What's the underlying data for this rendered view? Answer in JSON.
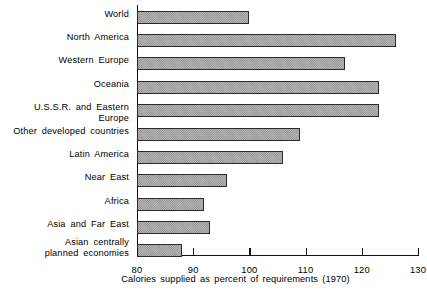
{
  "chart_data": {
    "type": "bar",
    "orientation": "horizontal",
    "title": "",
    "xlabel": "Calories supplied as percent of requirements (1970)",
    "ylabel": "",
    "xlim": [
      80,
      130
    ],
    "xticks": [
      80,
      90,
      100,
      110,
      120,
      130
    ],
    "xtick_labels": [
      "80",
      "90",
      "100",
      "110",
      "120",
      "130"
    ],
    "grid": false,
    "legend": null,
    "categories": [
      "World",
      "North America",
      "Western Europe",
      "Oceania",
      "U.S.S.R. and Eastern Europe",
      "Other developed countries",
      "Latin America",
      "Near East",
      "Africa",
      "Asia and Far East",
      "Asian centrally\nplanned economies"
    ],
    "values": [
      100,
      126,
      117,
      123,
      123,
      109,
      106,
      96,
      92,
      93,
      88
    ]
  },
  "axis": {
    "caption": "Calories supplied as percent of requirements (1970)"
  }
}
